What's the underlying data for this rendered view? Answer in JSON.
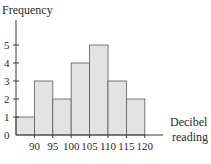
{
  "chart_data": {
    "type": "bar",
    "subtype": "histogram",
    "title": "",
    "xlabel": "Decibel reading",
    "xlabel_lines": [
      "Decibel",
      "reading"
    ],
    "ylabel": "Frequency",
    "bin_edges": [
      85,
      90,
      95,
      100,
      105,
      110,
      115,
      120
    ],
    "x_tick_labels": [
      "90",
      "95",
      "100",
      "105",
      "110",
      "115",
      "120"
    ],
    "bins": [
      {
        "from": 85,
        "to": 90,
        "count": 1
      },
      {
        "from": 90,
        "to": 95,
        "count": 3
      },
      {
        "from": 95,
        "to": 100,
        "count": 2
      },
      {
        "from": 100,
        "to": 105,
        "count": 4
      },
      {
        "from": 105,
        "to": 110,
        "count": 5
      },
      {
        "from": 110,
        "to": 115,
        "count": 3
      },
      {
        "from": 115,
        "to": 120,
        "count": 2
      }
    ],
    "values": [
      1,
      3,
      2,
      4,
      5,
      3,
      2
    ],
    "y_tick_labels": [
      "0",
      "1",
      "2",
      "3",
      "4",
      "5"
    ],
    "ylim": [
      0,
      6
    ],
    "grid": false,
    "legend": null,
    "colors": {
      "bar_fill": "#e3e3e3",
      "bar_edge": "#5a5a5a",
      "axis": "#3a3a3a"
    }
  }
}
